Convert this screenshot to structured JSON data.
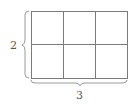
{
  "diagram": {
    "type": "area-grid",
    "rows": 2,
    "columns": 3,
    "labels": {
      "height": "2",
      "width": "3"
    },
    "colors": {
      "grid_line": "#7a7a7a",
      "brace": "#9a9a9a",
      "label": "#555555"
    }
  }
}
